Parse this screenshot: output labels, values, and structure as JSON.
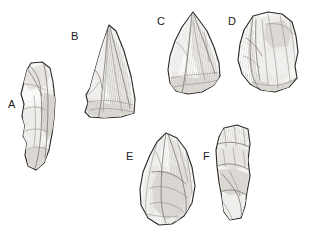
{
  "plate": {
    "title": "Lithic artifact plate",
    "background_color": "#ffffff",
    "ink_color": "#2a2724",
    "shade_color": "#e2dfdb",
    "label_color": "#1b1b1b",
    "figure_count": 6,
    "style": "pen-and-ink archaeological illustration with hatching and stipple"
  },
  "artifacts": [
    {
      "label": "A",
      "name": "elongated-retouched-blade",
      "label_x": 8,
      "label_y": 99,
      "bbox": [
        18,
        62,
        37,
        108
      ],
      "description": "Narrow elongated flake blade with steeply retouched left margin and a notched lower edge"
    },
    {
      "label": "B",
      "name": "triangular-point",
      "label_x": 71,
      "label_y": 31,
      "bbox": [
        82,
        25,
        53,
        93
      ],
      "description": "Large triangular point with a prominent median ridge and a broad flat base"
    },
    {
      "label": "C",
      "name": "convergent-point-flake",
      "label_x": 157,
      "label_y": 16,
      "bbox": [
        168,
        12,
        52,
        82
      ],
      "description": "Convergent pointed flake with converging dorsal scars and a rounded base"
    },
    {
      "label": "D",
      "name": "broad-side-scraper",
      "label_x": 228,
      "label_y": 16,
      "bbox": [
        238,
        12,
        60,
        80
      ],
      "description": "Broad sub-quadrangular flake scraper with a steep retouched lateral edge"
    },
    {
      "label": "E",
      "name": "leaf-shaped-biface",
      "label_x": 126,
      "label_y": 151,
      "bbox": [
        140,
        133,
        55,
        92
      ],
      "description": "Leaf-shaped teardrop biface with invasive flake scars over the entire face"
    },
    {
      "label": "F",
      "name": "blade-fragment",
      "label_x": 203,
      "label_y": 151,
      "bbox": [
        215,
        125,
        36,
        95
      ],
      "description": "Elongated blade fragment with transverse scar terminations along the upper dorsal face"
    }
  ]
}
